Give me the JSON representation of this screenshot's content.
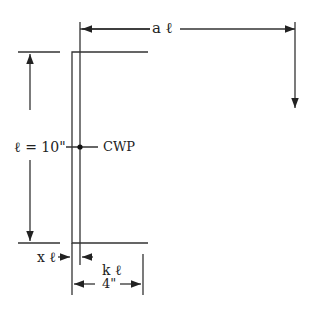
{
  "diagram": {
    "type": "channel-section dimension sketch",
    "labels": {
      "a_ell": "a ℓ",
      "ell_eq": "ℓ = 10\"",
      "cwp": "CWP",
      "x_ell": "x ℓ",
      "k_ell": "k ℓ",
      "width": "4\""
    },
    "colors": {
      "line": "#333333",
      "background": "#ffffff"
    }
  }
}
